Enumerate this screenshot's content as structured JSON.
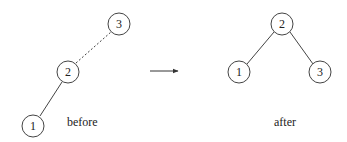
{
  "diagram": {
    "type": "tree-rotation",
    "before": {
      "caption": "before",
      "nodes": [
        {
          "id": "3",
          "label": "3"
        },
        {
          "id": "2",
          "label": "2"
        },
        {
          "id": "1",
          "label": "1"
        }
      ],
      "edges": [
        {
          "from": "2",
          "to": "3",
          "style": "dashed"
        },
        {
          "from": "2",
          "to": "1",
          "style": "solid"
        }
      ]
    },
    "arrow": {
      "direction": "right"
    },
    "after": {
      "caption": "after",
      "nodes": [
        {
          "id": "2",
          "label": "2"
        },
        {
          "id": "1",
          "label": "1"
        },
        {
          "id": "3",
          "label": "3"
        }
      ],
      "edges": [
        {
          "from": "2",
          "to": "1",
          "style": "solid"
        },
        {
          "from": "2",
          "to": "3",
          "style": "solid"
        }
      ]
    },
    "colors": {
      "stroke": "#333333",
      "background": "#ffffff"
    }
  }
}
